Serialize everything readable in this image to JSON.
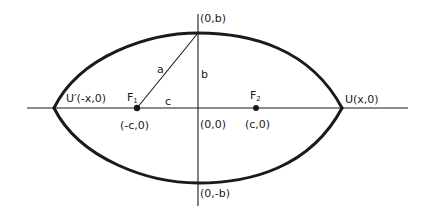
{
  "diagram": {
    "type": "lens-shaped curve with foci on coordinate axes",
    "colors": {
      "ink": "#1a1a1a",
      "background": "#ffffff"
    },
    "axes": {
      "horizontal": {
        "label": ""
      },
      "vertical": {
        "label": ""
      }
    },
    "points": {
      "top": {
        "label": "(0,b)"
      },
      "bottom": {
        "label": "(0,-b)"
      },
      "origin": {
        "label": "(0,0)"
      },
      "right_vertex": {
        "label": "U(x,0)"
      },
      "left_vertex": {
        "label_prefix": "U′",
        "label_coords": "(-x,0)"
      },
      "focus1": {
        "name": "F",
        "subscript": "1",
        "coords": "(-c,0)"
      },
      "focus2": {
        "name": "F",
        "subscript": "2",
        "coords": "(c,0)"
      }
    },
    "segments": {
      "hypotenuse": {
        "label": "a"
      },
      "vertical": {
        "label": "b"
      },
      "horizontal": {
        "label": "c"
      }
    }
  }
}
